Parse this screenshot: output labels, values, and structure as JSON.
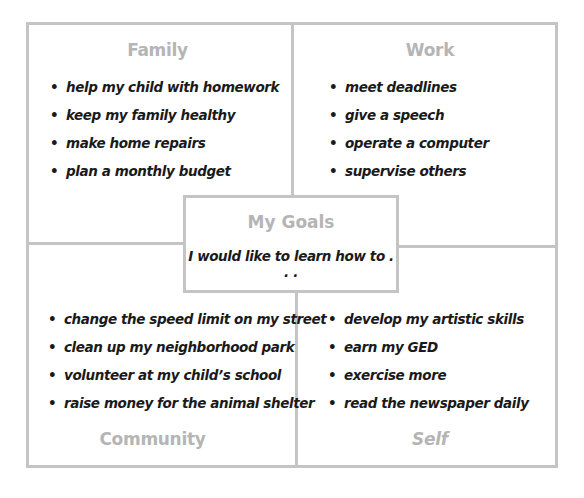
{
  "center": {
    "title": "My Goals",
    "subtitle": "I would like to learn how to . . ."
  },
  "quadrants": {
    "family": {
      "title": "Family",
      "items": [
        "help my child with homework",
        "keep my family healthy",
        "make home repairs",
        "plan a monthly budget"
      ]
    },
    "work": {
      "title": "Work",
      "items": [
        "meet deadlines",
        "give a speech",
        "operate a computer",
        "supervise others"
      ]
    },
    "community": {
      "title": "Community",
      "items": [
        "change the speed limit on my street",
        "clean up my neighborhood park",
        "volunteer at my child’s school",
        "raise money for the animal shelter"
      ]
    },
    "self": {
      "title": "Self",
      "items": [
        "develop my artistic skills",
        "earn my GED",
        "exercise more",
        "read the newspaper daily"
      ]
    }
  },
  "bullet": "•",
  "colors": {
    "line": "#c4c4c4",
    "heading": "#b5b5b5",
    "text": "#1a1a1a"
  }
}
